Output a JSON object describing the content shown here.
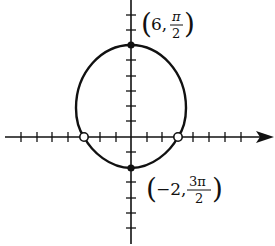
{
  "diagram": {
    "type": "polar-graph",
    "curve": "limaçon (convex)",
    "colors": {
      "ink": "#111111",
      "background": "#ffffff"
    },
    "axes": {
      "origin_px": [
        131,
        137
      ],
      "unit_px": 15.5,
      "x_ticks_left": 7,
      "x_ticks_right": 7,
      "y_ticks_up": 8,
      "y_ticks_down": 6
    },
    "points": [
      {
        "id": "top",
        "coords": [
          0,
          6
        ],
        "style": "filled",
        "label_r": "6",
        "label_theta_num": "π",
        "label_theta_den": "2"
      },
      {
        "id": "bottom",
        "coords": [
          0,
          -2
        ],
        "style": "filled",
        "label_r": "−2",
        "label_theta_num": "3π",
        "label_theta_den": "2"
      },
      {
        "id": "left-intercept",
        "coords": [
          -3,
          0
        ],
        "style": "open"
      },
      {
        "id": "right-intercept",
        "coords": [
          3,
          0
        ],
        "style": "open"
      }
    ],
    "labels": {
      "top": {
        "open": "(",
        "r": "6,",
        "num": "π",
        "den": "2",
        "close": ")"
      },
      "bottom": {
        "open": "(",
        "r": "−2,",
        "num": "3π",
        "den": "2",
        "close": ")"
      }
    }
  }
}
